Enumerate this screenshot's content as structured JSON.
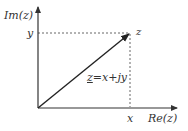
{
  "diagram": {
    "colors": {
      "axis": "#333333",
      "vector": "#222222",
      "dashed": "#666666",
      "text": "#333333",
      "background": "#ffffff"
    },
    "axes": {
      "vertical_label": "Im(z)",
      "horizontal_label": "Re(z)"
    },
    "point": {
      "label": "z",
      "x_label": "x",
      "y_label": "y"
    },
    "equation": {
      "lhs": "z",
      "rhs": "=x+jy"
    }
  }
}
